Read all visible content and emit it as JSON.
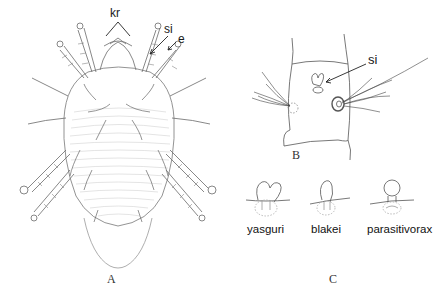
{
  "figure": {
    "panels": [
      {
        "id": "A",
        "label": "A",
        "description": "dorsal view of whole mite"
      },
      {
        "id": "B",
        "label": "B",
        "description": "leg segment with solenidion"
      },
      {
        "id": "C",
        "label": "C",
        "description": "solenidion shapes of three species"
      }
    ],
    "annotations": {
      "kr": "kr",
      "si_a": "si",
      "e": "e",
      "si_b": "si"
    },
    "species": [
      "yasguri",
      "blakei",
      "parasitivorax"
    ],
    "colors": {
      "background": "#ffffff",
      "line": "#555555",
      "text": "#1a1a1a"
    }
  }
}
